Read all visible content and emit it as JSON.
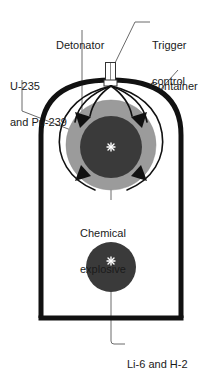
{
  "diagram": {
    "background_color": "#ffffff",
    "text_color": "#1a1a1a",
    "colors": {
      "container_outline": "#111111",
      "chemical_explosive_fill": "#9b9b9b",
      "fissile_core_fill": "#3a3a3a",
      "fusion_sphere_fill": "#3a3a3a",
      "leader_line": "#6b6b6b",
      "detonation_wave": "#111111",
      "spark": "#ffffff"
    },
    "labels": [
      {
        "id": "detonator",
        "name": "detonator",
        "text": "Detonator",
        "lines": [
          "Detonator"
        ],
        "x": 56,
        "y": 15
      },
      {
        "id": "trigger-control",
        "name": "trigger-control",
        "text": "Trigger control",
        "lines": [
          "Trigger",
          "control"
        ],
        "x": 152,
        "y": 15
      },
      {
        "id": "fissile-material",
        "name": "fissile-material",
        "text": "U-235 and Pu-239",
        "lines": [
          "U-235",
          "and Pu-239"
        ],
        "x": 10,
        "y": 56
      },
      {
        "id": "container",
        "name": "container",
        "text": "Container",
        "lines": [
          "Container"
        ],
        "x": 150,
        "y": 56
      },
      {
        "id": "chemical-explosive",
        "name": "chemical-explosive",
        "text": "Chemical explosive",
        "lines": [
          "Chemical",
          "explosive"
        ],
        "x": 80,
        "y": 203
      },
      {
        "id": "fusion-fuel",
        "name": "fusion-fuel",
        "text": "Li-6 and H-2",
        "lines": [
          "Li-6 and H-2"
        ],
        "x": 127,
        "y": 334
      }
    ],
    "parts": {
      "container": {
        "left": 38,
        "right": 184,
        "bottom": 320,
        "dome_top": 76
      },
      "trigger_nozzle": {
        "x": 105,
        "y": 62,
        "width": 11,
        "height": 22
      },
      "chemical_explosive_sphere": {
        "cx": 111,
        "cy": 145,
        "r": 45
      },
      "fissile_core_sphere": {
        "cx": 111,
        "cy": 147,
        "r": 31
      },
      "fusion_sphere": {
        "cx": 111,
        "cy": 267,
        "r": 25
      },
      "detonation_wave_arrow_count": 4
    }
  }
}
